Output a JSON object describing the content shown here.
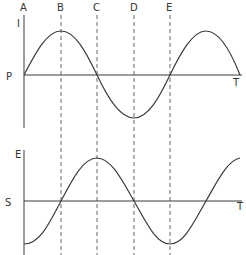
{
  "diagram": {
    "colors": {
      "line": "#3a3a3a",
      "dashed": "#555555",
      "background": "#ffffff"
    },
    "markers": [
      {
        "label": "A",
        "x": 24
      },
      {
        "label": "B",
        "x": 61
      },
      {
        "label": "C",
        "x": 97
      },
      {
        "label": "D",
        "x": 134
      },
      {
        "label": "E",
        "x": 170
      }
    ],
    "top_graph": {
      "y_axis_label": "I",
      "origin_label": "P",
      "x_axis_label": "T",
      "curve": "sine"
    },
    "bottom_graph": {
      "y_axis_label": "E",
      "origin_label": "S",
      "x_axis_label": "T",
      "curve": "negative cosine"
    }
  }
}
